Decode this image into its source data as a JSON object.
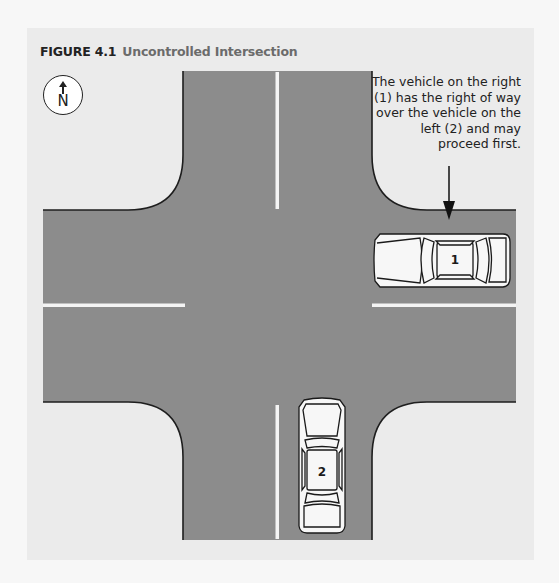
{
  "figure": {
    "number": "FIGURE 4.1",
    "title": "Uncontrolled Intersection"
  },
  "compass": {
    "icon": "north-arrow-icon",
    "label": "N"
  },
  "caption": {
    "text": "The vehicle on the right (1) has the right of way over the vehicle on the left (2) and may proceed first."
  },
  "vehicles": [
    {
      "id": "1",
      "label": "1",
      "heading": "west",
      "position": "east approach"
    },
    {
      "id": "2",
      "label": "2",
      "heading": "north",
      "position": "south approach"
    }
  ],
  "colors": {
    "road": "#8c8c8c",
    "background": "#ebebeb",
    "lane_marking": "#f4f4f4",
    "curb": "#1e1e1e",
    "car_body": "#f7f7f7"
  }
}
